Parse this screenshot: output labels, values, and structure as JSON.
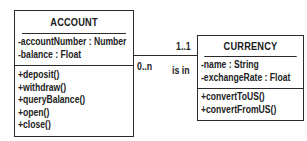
{
  "diagram": {
    "type": "UML class diagram",
    "classes": [
      {
        "name": "ACCOUNT",
        "attributes": [
          "-accountNumber : Number",
          "-balance : Float"
        ],
        "operations": [
          "+deposit()",
          "+withdraw()",
          "+queryBalance()",
          "+open()",
          "+close()"
        ]
      },
      {
        "name": "CURRENCY",
        "attributes": [
          "-name : String",
          "-exchangeRate : Float"
        ],
        "operations": [
          "+convertToUS()",
          "+convertFromUS()"
        ]
      }
    ],
    "association": {
      "name": "is in",
      "from": "ACCOUNT",
      "to": "CURRENCY",
      "from_multiplicity": "0..n",
      "to_multiplicity": "1..1"
    }
  }
}
